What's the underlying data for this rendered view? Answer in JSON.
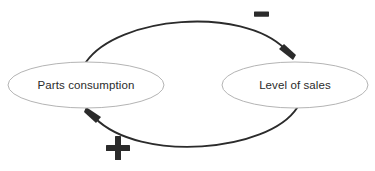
{
  "diagram": {
    "type": "causal-loop-diagram",
    "background_color": "#ffffff",
    "node_stroke_color": "#b4b4b4",
    "link_color": "#2b2b2b",
    "text_color": "#2b2b2b",
    "nodes": [
      {
        "id": "parts-consumption",
        "label": "Parts consumption",
        "cx": 86,
        "cy": 85,
        "rx": 78,
        "ry": 23
      },
      {
        "id": "level-of-sales",
        "label": "Level of sales",
        "cx": 295,
        "cy": 85,
        "rx": 73,
        "ry": 23
      }
    ],
    "links": [
      {
        "id": "sales-to-consumption-negative",
        "from": "parts-consumption",
        "to": "level-of-sales",
        "polarity": "-",
        "polarity_label": "-",
        "polarity_x": 261,
        "polarity_y": 14,
        "position": "top"
      },
      {
        "id": "consumption-to-sales-positive",
        "from": "level-of-sales",
        "to": "parts-consumption",
        "polarity": "+",
        "polarity_label": "+",
        "polarity_x": 118,
        "polarity_y": 148,
        "position": "bottom"
      }
    ]
  }
}
